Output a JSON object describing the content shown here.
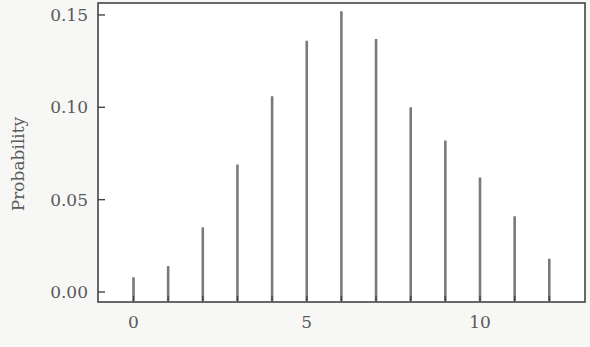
{
  "chart_data": {
    "type": "bar",
    "title": "",
    "xlabel": "",
    "ylabel": "Probability",
    "categories": [
      0,
      1,
      2,
      3,
      4,
      5,
      6,
      7,
      8,
      9,
      10,
      11,
      12
    ],
    "values": [
      0.008,
      0.014,
      0.035,
      0.069,
      0.106,
      0.136,
      0.152,
      0.137,
      0.1,
      0.082,
      0.062,
      0.041,
      0.018
    ],
    "xticks": [
      0,
      5,
      10
    ],
    "xtick_labels": [
      "0",
      "5",
      "10"
    ],
    "yticks": [
      0.0,
      0.05,
      0.1,
      0.15
    ],
    "ytick_labels": [
      "0.00",
      "0.05",
      "0.10",
      "0.15"
    ],
    "ylim": [
      -0.006,
      0.155
    ],
    "xlim": [
      -1,
      13
    ],
    "grid": false,
    "legend": null,
    "style": "needle/spike plot (vertical lines)",
    "colors": {
      "bar": "#7a7a7a",
      "axis": "#444444",
      "text": "#5a5a5a",
      "background": "#f7f7f5"
    }
  }
}
